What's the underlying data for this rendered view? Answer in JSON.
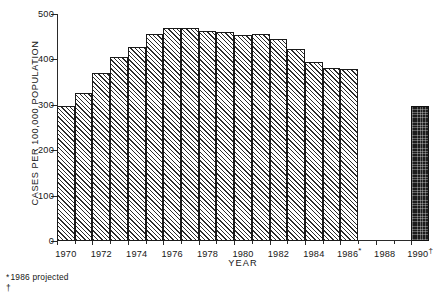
{
  "chart_data": {
    "type": "bar",
    "title": "",
    "subtitle": "",
    "xlabel": "YEAR",
    "ylabel": "CASES PER 100,000 POPULATION",
    "ylim": [
      0,
      500
    ],
    "yticks": [
      0,
      100,
      200,
      300,
      400,
      500
    ],
    "ytick_labels": [
      "0",
      "100",
      "200",
      "300",
      "400",
      "500"
    ],
    "xlim": [
      1969.5,
      1990.5
    ],
    "xticks": [
      1970,
      1972,
      1974,
      1976,
      1978,
      1980,
      1982,
      1984,
      1986,
      1988,
      1990
    ],
    "xtick_labels": [
      "1970",
      "1972",
      "1974",
      "1976",
      "1978",
      "1980",
      "1982",
      "1984",
      "1986",
      "1988",
      "1990"
    ],
    "xtick_marks": [
      "",
      "",
      "",
      "",
      "",
      "",
      "",
      "",
      "*",
      "",
      "†"
    ],
    "grid": false,
    "legend_position": "none",
    "categories": [
      "1970",
      "1971",
      "1972",
      "1973",
      "1974",
      "1975",
      "1976",
      "1977",
      "1978",
      "1979",
      "1980",
      "1981",
      "1982",
      "1983",
      "1984",
      "1985",
      "1986",
      "1990"
    ],
    "values": [
      297,
      325,
      370,
      405,
      428,
      455,
      470,
      470,
      462,
      460,
      453,
      455,
      445,
      422,
      395,
      382,
      378,
      297
    ],
    "bar_styles": [
      "hatched",
      "hatched",
      "hatched",
      "hatched",
      "hatched",
      "hatched",
      "hatched",
      "hatched",
      "hatched",
      "hatched",
      "hatched",
      "hatched",
      "hatched",
      "hatched",
      "hatched",
      "hatched",
      "hatched",
      "solid"
    ],
    "gap_years": [
      "1987",
      "1988",
      "1989"
    ],
    "annotations": [
      {
        "marker": "*",
        "text": "1986 projected"
      },
      {
        "marker": "†",
        "text": ""
      }
    ]
  },
  "footnotes": [
    {
      "marker": "*",
      "text": "1986 projected"
    },
    {
      "marker": "†",
      "text": ""
    }
  ],
  "colors": {
    "ink": "#1a1a1a",
    "hatch": "#2b2b2b",
    "solid_bar": "#1c1c1c",
    "background": "#ffffff"
  }
}
